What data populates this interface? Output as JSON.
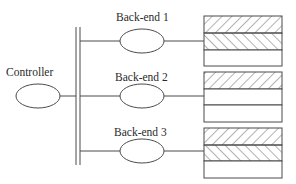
{
  "diagram": {
    "controller": {
      "label": "Controller"
    },
    "backends": [
      {
        "label": "Back-end 1",
        "storage_bands": [
          "hatched-forward",
          "hatched-backward",
          "empty"
        ]
      },
      {
        "label": "Back-end 2",
        "storage_bands": [
          "hatched-forward",
          "empty",
          "empty"
        ]
      },
      {
        "label": "Back-end 3",
        "storage_bands": [
          "hatched-forward",
          "hatched-backward",
          "empty"
        ]
      }
    ],
    "colors": {
      "stroke": "#4a4a4a",
      "background": "#ffffff"
    }
  }
}
